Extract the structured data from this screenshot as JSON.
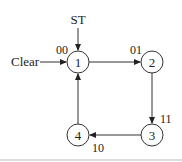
{
  "diagram": {
    "type": "state-diagram",
    "inputs": {
      "start": "ST",
      "clear": "Clear"
    },
    "states": [
      {
        "id": "1",
        "code": "00"
      },
      {
        "id": "2",
        "code": "01"
      },
      {
        "id": "3",
        "code": "11"
      },
      {
        "id": "4",
        "code": "10"
      }
    ],
    "transitions": [
      {
        "from": "1",
        "to": "2"
      },
      {
        "from": "2",
        "to": "3"
      },
      {
        "from": "3",
        "to": "4"
      },
      {
        "from": "4",
        "to": "1"
      }
    ]
  }
}
